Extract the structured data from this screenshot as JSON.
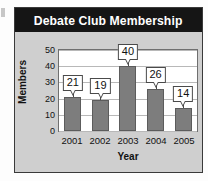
{
  "chart_data": {
    "type": "bar",
    "title": "Debate Club Membership",
    "xlabel": "Year",
    "ylabel": "Members",
    "categories": [
      "2001",
      "2002",
      "2003",
      "2004",
      "2005"
    ],
    "values": [
      21,
      19,
      40,
      26,
      14
    ],
    "data_labels": [
      "21",
      "19",
      "40",
      "26",
      "14"
    ],
    "ylim": [
      0,
      50
    ],
    "yticks": [
      50,
      40,
      30,
      20,
      10,
      0
    ],
    "ytick_labels": [
      "50",
      "40",
      "30",
      "20",
      "10",
      "0"
    ],
    "grid": "horizontal",
    "legend": "none",
    "colors": {
      "bar_fill": "#7d7d7d",
      "bar_stroke": "#5c5c5c",
      "title_bar": "#151515",
      "title_text": "#ffffff",
      "panel_background": "#cfcfcf",
      "plot_background": "#ffffff",
      "gridline": "#b8b8b8",
      "callout_fill": "#ffffff",
      "callout_stroke": "#4a4a4a"
    }
  }
}
